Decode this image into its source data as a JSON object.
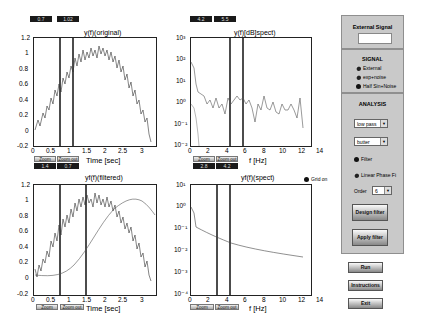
{
  "plots": {
    "time_original": {
      "title": "y(f)(original)",
      "cursor_values": [
        "0.7",
        "1.02"
      ],
      "bottom_values": [
        "1.4",
        "0.7"
      ],
      "xlabel": "Time [sec]",
      "xticks": [
        "0",
        "0.5",
        "1",
        "1.5",
        "2",
        "2.5",
        "3",
        "3.5"
      ],
      "yticks": [
        "1.2",
        "1",
        "0.8",
        "0.6",
        "0.4",
        "0.2",
        "0",
        "-0.2"
      ],
      "zoom_label": "Zoom",
      "zoom_out_label": "Zoom out"
    },
    "spect_original": {
      "title": "y(f)[dB]spect)",
      "cursor_values": [
        "4.2",
        "5.5"
      ],
      "bottom_values": [
        "2.8",
        "4.2"
      ],
      "xlabel": "f [Hz]",
      "xticks": [
        "0",
        "2",
        "4",
        "6",
        "8",
        "10",
        "12",
        "14"
      ],
      "yticks": [
        "10³",
        "10²",
        "10¹",
        "10⁰",
        "10⁻¹",
        "10⁻²"
      ],
      "zoom_label": "Zoom",
      "zoom_out_label": "Zoom out"
    },
    "time_filtered": {
      "title": "yf(f)(filtered)",
      "xlabel": "Time [sec]",
      "xticks": [
        "0",
        "0.5",
        "1",
        "1.5",
        "2",
        "2.5",
        "3",
        "3.5"
      ],
      "yticks": [
        "1.2",
        "1",
        "0.8",
        "0.6",
        "0.4",
        "0.2",
        "0",
        "-0.2"
      ],
      "zoom_label": "Zoom",
      "zoom_out_label": "Zoom out"
    },
    "spect_filtered": {
      "title": "yf(f)(spect)",
      "xlabel": "f [Hz]",
      "xticks": [
        "0",
        "2",
        "4",
        "6",
        "8",
        "10",
        "12",
        "14"
      ],
      "yticks": [
        "10¹",
        "10⁰",
        "10⁻¹",
        "10⁻²",
        "10⁻³",
        "10⁻⁴"
      ],
      "zoom_label": "Zoom",
      "zoom_out_label": "Zoom out"
    }
  },
  "grid_toggle": {
    "label": "Grid on",
    "checked": true
  },
  "external_signal": {
    "title": "External Signal",
    "value": ""
  },
  "signal": {
    "title": "SIGNAL",
    "options": [
      {
        "label": "External",
        "selected": false
      },
      {
        "label": "exp+noise",
        "selected": false
      },
      {
        "label": "Half Sin+Noise",
        "selected": true
      }
    ]
  },
  "analysis": {
    "title": "ANALYSIS",
    "filter_type": "low pass",
    "filter_design": "butter",
    "radio_filter": "Filter",
    "radio_linear": "Linear Phase Fi",
    "order_label": "Order",
    "order_value": "6",
    "design_label": "Design filter",
    "apply_label": "Apply filter"
  },
  "actions": {
    "run": "Run",
    "instructions": "Instructions",
    "exit": "Exit"
  }
}
